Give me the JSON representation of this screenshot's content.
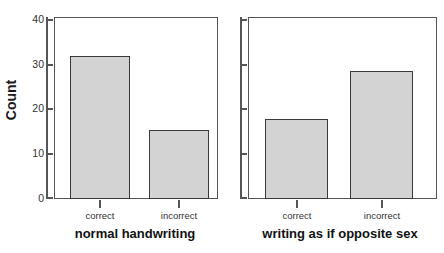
{
  "chart_data": {
    "type": "bar",
    "title": "",
    "subtitle": "",
    "xlabel": "",
    "ylabel": "Count",
    "ylim": [
      0,
      42
    ],
    "yticks": [
      0,
      10,
      20,
      30,
      40
    ],
    "ytick_labels": [
      "0",
      "10",
      "20",
      "30",
      "40"
    ],
    "grid": false,
    "legend": "none",
    "categories": [
      "correct",
      "incorrect"
    ],
    "panels": [
      {
        "label": "normal handwriting",
        "categories": [
          "correct",
          "incorrect"
        ],
        "values": [
          33,
          16
        ]
      },
      {
        "label": "writing as if opposite sex",
        "categories": [
          "correct",
          "incorrect"
        ],
        "values": [
          18.5,
          29.5
        ]
      }
    ],
    "bar_fill_color": "#d3d3d3",
    "bar_edge_color": "#3a3a3a",
    "axis_color": "#555555"
  },
  "axis": {
    "y_title": "Count",
    "ticks": [
      {
        "value": 40,
        "label": "40"
      },
      {
        "value": 30,
        "label": "30"
      },
      {
        "value": 20,
        "label": "20"
      },
      {
        "value": 10,
        "label": "10"
      },
      {
        "value": 0,
        "label": "0"
      }
    ]
  },
  "panel_left": {
    "title": "normal handwriting",
    "bar1_label": "correct",
    "bar2_label": "incorrect",
    "bar1_value": 33,
    "bar2_value": 16
  },
  "panel_right": {
    "title": "writing as if opposite sex",
    "bar1_label": "correct",
    "bar2_label": "incorrect",
    "bar1_value": 18.5,
    "bar2_value": 29.5
  }
}
